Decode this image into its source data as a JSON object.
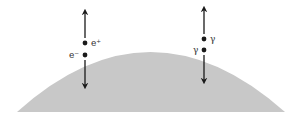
{
  "diagram": {
    "surface_color": "#c8c8c8",
    "ink_color": "#1a1a1a",
    "pairs": [
      {
        "name": "electron-positron-pair",
        "upper_label": "e⁺",
        "lower_label": "e⁻",
        "upper_particle": "positron",
        "lower_particle": "electron"
      },
      {
        "name": "photon-pair",
        "upper_label": "γ",
        "lower_label": "γ",
        "upper_particle": "photon",
        "lower_particle": "photon"
      }
    ]
  }
}
